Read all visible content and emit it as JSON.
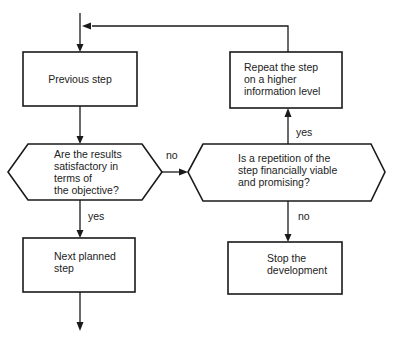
{
  "diagram": {
    "type": "flowchart",
    "colors": {
      "stroke": "#1a1a1a",
      "text": "#222222",
      "background": "#ffffff"
    },
    "nodes": {
      "previous_step": {
        "shape": "rectangle",
        "lines": [
          "Previous step"
        ]
      },
      "results_satisfactory": {
        "shape": "hexagon-decision",
        "lines": [
          "Are the results",
          "satisfactory in",
          "terms of",
          "the objective?"
        ]
      },
      "next_planned_step": {
        "shape": "rectangle",
        "lines": [
          "Next planned",
          "step"
        ]
      },
      "repetition_viable": {
        "shape": "hexagon-decision",
        "lines": [
          "Is a repetition of the",
          "step financially viable",
          "and promising?"
        ]
      },
      "repeat_step": {
        "shape": "rectangle",
        "lines": [
          "Repeat the step",
          "on a higher",
          "information level"
        ]
      },
      "stop_development": {
        "shape": "rectangle",
        "lines": [
          "Stop the",
          "development"
        ]
      }
    },
    "edges": {
      "results_no": {
        "from": "results_satisfactory",
        "to": "repetition_viable",
        "label": "no"
      },
      "results_yes": {
        "from": "results_satisfactory",
        "to": "next_planned_step",
        "label": "yes"
      },
      "repetition_yes": {
        "from": "repetition_viable",
        "to": "repeat_step",
        "label": "yes"
      },
      "repetition_no": {
        "from": "repetition_viable",
        "to": "stop_development",
        "label": "no"
      },
      "repeat_loop": {
        "from": "repeat_step",
        "to": "previous_step",
        "label": ""
      },
      "entry": {
        "from": "",
        "to": "previous_step",
        "label": ""
      },
      "exit": {
        "from": "next_planned_step",
        "to": "",
        "label": ""
      }
    }
  }
}
